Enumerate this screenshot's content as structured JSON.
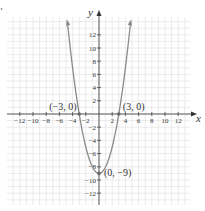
{
  "chart_data": {
    "type": "line",
    "title": "",
    "function": "y = x^2 - 9",
    "xlabel": "x",
    "ylabel": "y",
    "xlim": [
      -14,
      14
    ],
    "ylim": [
      -14,
      14
    ],
    "grid": true,
    "x_ticks": [
      -12,
      -10,
      -8,
      -6,
      -4,
      -2,
      2,
      4,
      6,
      8,
      10,
      12
    ],
    "y_ticks": [
      12,
      10,
      8,
      6,
      4,
      2,
      -2,
      -4,
      -6,
      -8,
      -10,
      -12
    ],
    "x_tick_labels": [
      "−12",
      "−10",
      "−8",
      "−6",
      "−4",
      "−2",
      "2",
      "4",
      "6",
      "8",
      "10",
      "12"
    ],
    "y_tick_labels": [
      "12",
      "10",
      "8",
      "6",
      "4",
      "2",
      "−2",
      "−4",
      "−6",
      "−8",
      "−10",
      "−12"
    ],
    "series": [
      {
        "name": "parabola",
        "x": [
          -4.8,
          -4,
          -3,
          -2,
          -1,
          0,
          1,
          2,
          3,
          4,
          4.8
        ],
        "y": [
          14.04,
          7,
          0,
          -5,
          -8,
          -9,
          -8,
          -5,
          0,
          7,
          14.04
        ]
      }
    ],
    "annotations": [
      {
        "label": "(−3, 0)",
        "x": -3,
        "y": 0
      },
      {
        "label": "(3, 0)",
        "x": 3,
        "y": 0
      },
      {
        "label": "(0, −9)",
        "x": 0,
        "y": -9
      }
    ],
    "colors": {
      "curve": "#8a8a8a",
      "axis": "#333333",
      "grid": "#dddddd"
    }
  }
}
